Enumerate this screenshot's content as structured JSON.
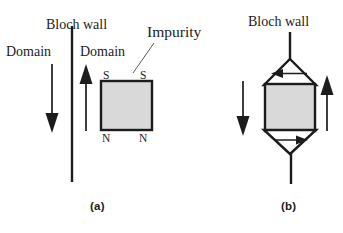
{
  "figure": {
    "type": "diagram",
    "background_color": "#ffffff",
    "line_color": "#1c1c1c",
    "impurity_fill_color": "#d9d9d9",
    "width": 343,
    "height": 233
  },
  "panel_a": {
    "caption": "(a)",
    "labels": {
      "bloch_wall": "Bloch wall",
      "domain_left": "Domain",
      "domain_right": "Domain",
      "impurity": "Impurity"
    },
    "poles": {
      "top_left": "S",
      "top_right": "S",
      "bottom_left": "N",
      "bottom_right": "N"
    },
    "arrows": [
      {
        "name": "left-domain-magnetization-arrow",
        "direction": "down"
      },
      {
        "name": "right-domain-magnetization-arrow",
        "direction": "up"
      }
    ],
    "wall": {
      "name": "straight-bloch-wall",
      "shape": "vertical-line"
    },
    "impurity_shape": "square"
  },
  "panel_b": {
    "caption": "(b)",
    "labels": {
      "bloch_wall": "Bloch wall"
    },
    "arrows": [
      {
        "name": "left-domain-magnetization-arrow",
        "direction": "down"
      },
      {
        "name": "right-domain-magnetization-arrow",
        "direction": "up"
      },
      {
        "name": "upper-spike-closure-arrow",
        "direction": "left"
      },
      {
        "name": "lower-spike-closure-arrow",
        "direction": "right"
      }
    ],
    "wall": {
      "name": "pinned-bloch-wall-with-spikes",
      "shape": "vertical-line-with-closure-triangles"
    },
    "impurity_shape": "square"
  }
}
